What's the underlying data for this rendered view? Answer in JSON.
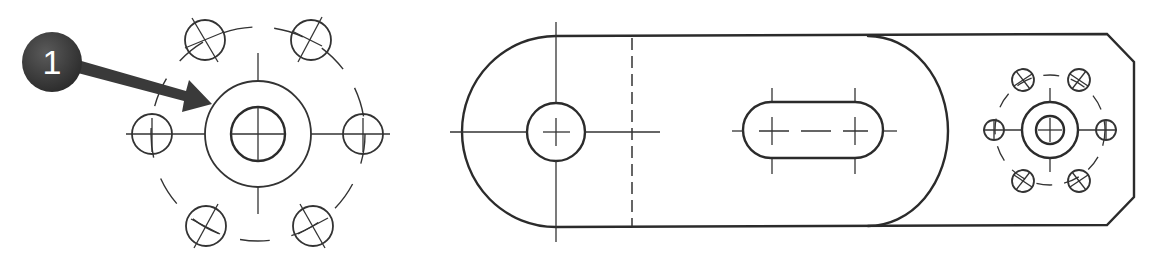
{
  "figure": {
    "background": "#ffffff",
    "line_color": "#2b2b2b"
  },
  "callout": {
    "number": "1",
    "badge_color": "#3a3a3a",
    "text_color": "#ffffff",
    "target": "outer hub circle of left view"
  },
  "left_view": {
    "name": "Flange end view",
    "center": [
      258,
      134
    ],
    "hub_outer_radius": 53,
    "bore_radius": 27,
    "bolt_circle_radius": 107,
    "hole_count": 6,
    "hole_radius": 20
  },
  "right_view": {
    "name": "Plate top view",
    "features": [
      "rounded end with hole",
      "hidden edge line",
      "slot",
      "large arc boss",
      "chamfered end",
      "small flange with 6 holes"
    ]
  }
}
